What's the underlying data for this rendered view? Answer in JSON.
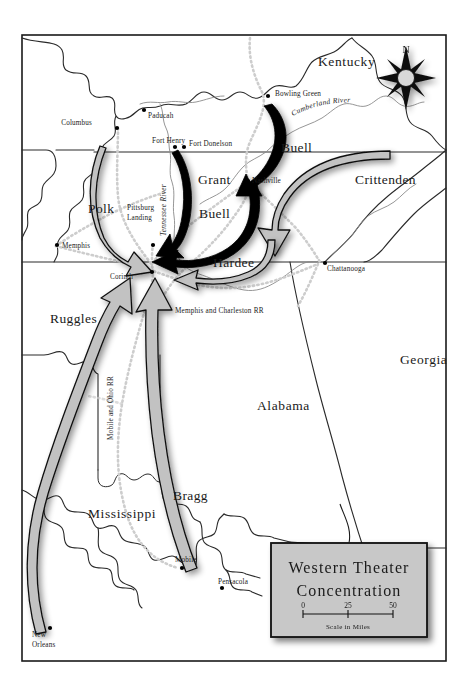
{
  "map": {
    "title_line1": "Western Theater",
    "title_line2": "Concentration",
    "scale": {
      "ticks": [
        "0",
        "25",
        "50"
      ],
      "caption": "Scale in Miles"
    },
    "compass": {
      "north_label": "N",
      "icon": "compass-rose-icon"
    },
    "colors": {
      "frame": "#1a1a1a",
      "state_border": "#2a2a2a",
      "river": "#7b7b7b",
      "railroad": "#c9c9c9",
      "union_arrow": "#000000",
      "confederate_arrow": "#b4b4b4",
      "title_box_fill": "#c8c8c8",
      "land": "#ffffff",
      "label_text": "#1a1a1a"
    },
    "states": [
      {
        "name": "Kentucky",
        "x": 318,
        "y": 66
      },
      {
        "name": "Georgia",
        "x": 400,
        "y": 364
      },
      {
        "name": "Alabama",
        "x": 257,
        "y": 410
      },
      {
        "name": "Mississippi",
        "x": 88,
        "y": 518
      }
    ],
    "commanders": [
      {
        "name": "Grant",
        "x": 198,
        "y": 184,
        "side": "union"
      },
      {
        "name": "Buell",
        "x": 199,
        "y": 218,
        "side": "union"
      },
      {
        "name": "Buell",
        "x": 281,
        "y": 152,
        "side": "union"
      },
      {
        "name": "Crittenden",
        "x": 355,
        "y": 184,
        "side": "confederate"
      },
      {
        "name": "Polk",
        "x": 88,
        "y": 213,
        "side": "confederate"
      },
      {
        "name": "Hardee",
        "x": 213,
        "y": 267,
        "side": "confederate"
      },
      {
        "name": "Ruggles",
        "x": 50,
        "y": 323,
        "side": "confederate"
      },
      {
        "name": "Bragg",
        "x": 173,
        "y": 500,
        "side": "confederate"
      }
    ],
    "cities": [
      {
        "name": "Columbus",
        "x": 92,
        "y": 125,
        "dot_x": 117,
        "dot_y": 128,
        "anchor": "end",
        "dx": -3
      },
      {
        "name": "Paducah",
        "x": 148,
        "y": 118,
        "dot_x": 144,
        "dot_y": 110,
        "anchor": "start",
        "dx": 0
      },
      {
        "name": "Fort Henry",
        "x": 152,
        "y": 143,
        "dot_x": 175,
        "dot_y": 147,
        "anchor": "start",
        "dx": 0
      },
      {
        "name": "Fort Donelson",
        "x": 189,
        "y": 146,
        "dot_x": 184,
        "dot_y": 147,
        "anchor": "start",
        "dx": 0
      },
      {
        "name": "Bowling Green",
        "x": 275,
        "y": 96,
        "dot_x": 268,
        "dot_y": 96,
        "anchor": "start",
        "dx": 0
      },
      {
        "name": "Nashville",
        "x": 252,
        "y": 183,
        "dot_x": 248,
        "dot_y": 181,
        "anchor": "start",
        "dx": 0
      },
      {
        "name": "Memphis",
        "x": 62,
        "y": 248,
        "dot_x": 57,
        "dot_y": 245,
        "anchor": "start",
        "dx": 0
      },
      {
        "name": "Corinth",
        "x": 110,
        "y": 279,
        "dot_x": 152,
        "dot_y": 272,
        "anchor": "start",
        "dx": 0
      },
      {
        "name": "Chattanooga",
        "x": 327,
        "y": 271,
        "dot_x": 325,
        "dot_y": 263,
        "anchor": "start",
        "dx": 0
      },
      {
        "name": "Mobile",
        "x": 175,
        "y": 562,
        "dot_x": 182,
        "dot_y": 568,
        "anchor": "start",
        "dx": 0
      },
      {
        "name": "Pensacola",
        "x": 218,
        "y": 584,
        "dot_x": 222,
        "dot_y": 588,
        "anchor": "start",
        "dx": 0
      }
    ],
    "city_multiline": [
      {
        "name_line1": "Pittsburg",
        "name_line2": "Landing",
        "x": 127,
        "y": 210,
        "dot_x": 153,
        "dot_y": 245
      },
      {
        "name_line1": "New",
        "name_line2": "Orleans",
        "x": 32,
        "y": 637,
        "dot_x": 50,
        "dot_y": 628
      }
    ],
    "rivers": [
      {
        "label": "Cumberland River",
        "x": 300,
        "y": 110
      },
      {
        "label": "Tennessee River",
        "x": 166,
        "y": 160
      }
    ],
    "railroads": [
      {
        "label": "Memphis and Charleston RR",
        "x": 175,
        "y": 311
      },
      {
        "label": "Mobile and Ohio RR",
        "x": 113,
        "y": 380
      }
    ],
    "movement_arrows": [
      {
        "name": "buell-from-bowling-green",
        "side": "union",
        "from": "Bowling Green",
        "to": "Nashville"
      },
      {
        "name": "grant-to-pittsburg-landing",
        "side": "union",
        "from": "Fort Henry",
        "to": "Pittsburg Landing"
      },
      {
        "name": "buell-to-pittsburg-landing",
        "side": "union",
        "from": "Nashville",
        "to": "Pittsburg Landing"
      },
      {
        "name": "polk-to-corinth",
        "side": "confederate",
        "from": "Columbus",
        "to": "Corinth"
      },
      {
        "name": "crittenden-to-nashville",
        "side": "confederate",
        "from": "east Tennessee",
        "to": "Nashville"
      },
      {
        "name": "hardee-to-corinth",
        "side": "confederate",
        "from": "Chattanooga",
        "to": "Corinth"
      },
      {
        "name": "ruggles-to-corinth",
        "side": "confederate",
        "from": "New Orleans",
        "to": "Corinth"
      },
      {
        "name": "bragg-to-corinth",
        "side": "confederate",
        "from": "Mobile",
        "to": "Corinth"
      }
    ]
  }
}
